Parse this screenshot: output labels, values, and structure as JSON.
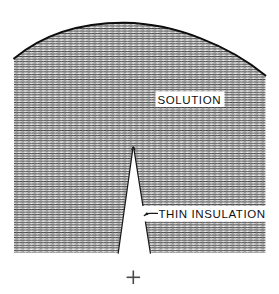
{
  "figure": {
    "background_color": "#ffffff",
    "ink_color": "#111111",
    "hatch_color": "#3d3d3d",
    "labels": {
      "solution": "SOLUTION",
      "thin_insulation": "THIN  INSULATION"
    },
    "registration_mark": "+",
    "icons": {
      "leader_arrow": "arrow-left-icon",
      "registration": "plus-crosshair-icon"
    },
    "regions": {
      "solution_fill": "horizontal-line-stipple",
      "insulation_wedge_fill": "#ffffff"
    },
    "geometry_note": "Dome-topped hatched solution body, x 14..265, arc apex near x 125 y 23; narrow white insulation wedge apex x 133 y 146 widening to base y 253."
  }
}
